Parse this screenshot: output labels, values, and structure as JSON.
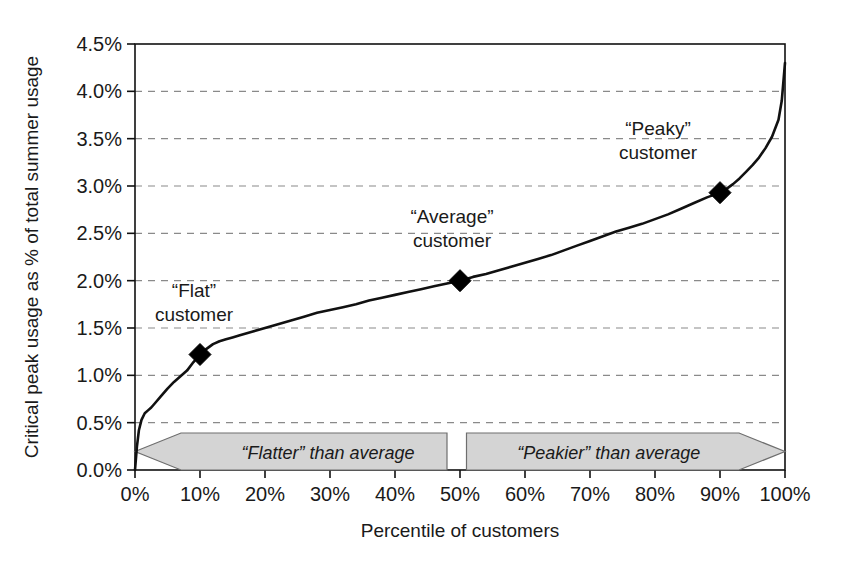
{
  "chart_data": {
    "type": "line",
    "title": "",
    "subtitle": "",
    "xlabel": "Percentile of customers",
    "ylabel": "Critical peak usage as % of total summer usage",
    "xlim": [
      0,
      100
    ],
    "ylim": [
      0,
      4.5
    ],
    "grid": "horizontal-dashed",
    "legend": "none",
    "x_ticks": [
      "0%",
      "10%",
      "20%",
      "30%",
      "40%",
      "50%",
      "60%",
      "70%",
      "80%",
      "90%",
      "100%"
    ],
    "x_tick_values": [
      0,
      10,
      20,
      30,
      40,
      50,
      60,
      70,
      80,
      90,
      100
    ],
    "y_ticks": [
      "0.0%",
      "0.5%",
      "1.0%",
      "1.5%",
      "2.0%",
      "2.5%",
      "3.0%",
      "3.5%",
      "4.0%",
      "4.5%"
    ],
    "y_tick_values": [
      0.0,
      0.5,
      1.0,
      1.5,
      2.0,
      2.5,
      3.0,
      3.5,
      4.0,
      4.5
    ],
    "series": [
      {
        "name": "Critical peak usage distribution",
        "x": [
          0,
          0.3,
          0.6,
          1,
          1.5,
          2,
          2.5,
          3,
          4,
          5,
          6,
          7,
          8,
          9,
          10,
          11,
          12,
          13,
          14,
          15,
          16,
          18,
          20,
          22,
          24,
          26,
          28,
          30,
          32,
          34,
          36,
          38,
          40,
          42,
          44,
          46,
          48,
          50,
          52,
          54,
          56,
          58,
          60,
          62,
          64,
          66,
          68,
          70,
          72,
          74,
          76,
          78,
          80,
          82,
          84,
          86,
          88,
          90,
          91,
          92,
          93,
          94,
          95,
          96,
          97,
          98,
          99,
          99.5,
          100
        ],
        "y": [
          0.0,
          0.25,
          0.42,
          0.53,
          0.6,
          0.63,
          0.66,
          0.7,
          0.78,
          0.86,
          0.93,
          0.99,
          1.05,
          1.14,
          1.22,
          1.28,
          1.33,
          1.36,
          1.38,
          1.4,
          1.42,
          1.46,
          1.5,
          1.54,
          1.58,
          1.62,
          1.66,
          1.69,
          1.72,
          1.75,
          1.79,
          1.82,
          1.85,
          1.88,
          1.91,
          1.94,
          1.97,
          2.0,
          2.04,
          2.07,
          2.11,
          2.15,
          2.19,
          2.23,
          2.27,
          2.32,
          2.37,
          2.42,
          2.47,
          2.52,
          2.56,
          2.6,
          2.65,
          2.7,
          2.76,
          2.82,
          2.88,
          2.93,
          2.97,
          3.02,
          3.08,
          3.15,
          3.22,
          3.3,
          3.4,
          3.52,
          3.7,
          3.9,
          4.3
        ]
      }
    ],
    "markers": [
      {
        "name": "flat-customer",
        "x": 10,
        "y": 1.22,
        "label_line1": "“Flat”",
        "label_line2": "customer"
      },
      {
        "name": "average-customer",
        "x": 50,
        "y": 2.0,
        "label_line1": "“Average”",
        "label_line2": "customer"
      },
      {
        "name": "peaky-customer",
        "x": 90,
        "y": 2.93,
        "label_line1": "“Peaky”",
        "label_line2": "customer"
      }
    ],
    "annotations": [
      {
        "name": "flatter-banner",
        "text": "“Flatter” than average",
        "direction": "left",
        "x_start": 0,
        "x_end": 48
      },
      {
        "name": "peakier-banner",
        "text": "“Peakier” than average",
        "direction": "right",
        "x_start": 51,
        "x_end": 100
      }
    ],
    "colors": {
      "line": "#111111",
      "marker": "#000000",
      "grid": "#8a8a8a",
      "axis": "#111111",
      "banner_fill": "#d4d4d4",
      "banner_stroke": "#6e6e6e",
      "background": "#ffffff"
    }
  }
}
